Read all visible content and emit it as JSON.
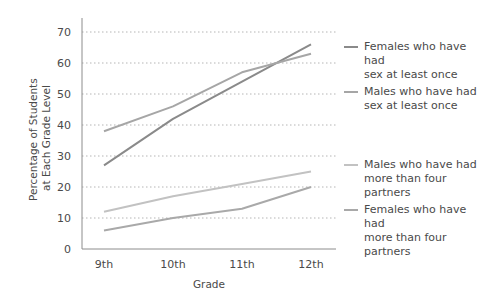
{
  "chart_data": {
    "type": "line",
    "title": "",
    "xlabel": "Grade",
    "ylabel": "Percentage of Students at Each Grade Level",
    "ylabel_lines": [
      "Percentage of Students",
      "at Each Grade Level"
    ],
    "categories": [
      "9th",
      "10th",
      "11th",
      "12th"
    ],
    "yticks": [
      0,
      10,
      20,
      30,
      40,
      50,
      60,
      70
    ],
    "ylim": [
      0,
      70
    ],
    "grid": "horizontal-dotted",
    "legend_position": "right",
    "series": [
      {
        "name": "Females who have had sex at least once",
        "label_lines": [
          "Females who have had",
          "sex at least once"
        ],
        "color": "#8a8a8a",
        "values": [
          27,
          42,
          54,
          66
        ]
      },
      {
        "name": "Males who have had sex at least once",
        "label_lines": [
          "Males who have had",
          "sex at least once"
        ],
        "color": "#a6a6a6",
        "values": [
          38,
          46,
          57,
          63
        ]
      },
      {
        "name": "Males who have had more than four partners",
        "label_lines": [
          "Males who have had",
          "more than four partners"
        ],
        "color": "#c2c2c2",
        "values": [
          12,
          17,
          21,
          25
        ]
      },
      {
        "name": "Females who have had more than four partners",
        "label_lines": [
          "Females who have had",
          "more than four partners"
        ],
        "color": "#a9a9a9",
        "values": [
          6,
          10,
          13,
          20
        ]
      }
    ]
  }
}
